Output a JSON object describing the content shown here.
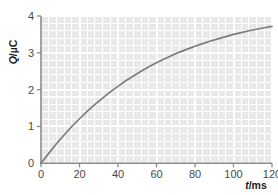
{
  "figure": {
    "background_color": "#ffffff",
    "plot_fill_color": "#e9e9e9",
    "gridline_color": "#ffffff",
    "axis_color": "#8a8a8a",
    "curve_color": "#7d7d7d",
    "tick_label_color": "#4a4a4a",
    "axis_title_color": "#1c1c1c"
  },
  "axis_titles": {
    "y": "Q/µC",
    "y_symbol": "Q",
    "y_unit": "/µC",
    "x": "t/ms",
    "x_symbol": "t",
    "x_unit": "/ms"
  },
  "ticks": {
    "x_labels": [
      "0",
      "20",
      "40",
      "60",
      "80",
      "100",
      "120"
    ],
    "y_labels": [
      "0",
      "1",
      "2",
      "3",
      "4"
    ]
  },
  "chart_data": {
    "type": "line",
    "title": "",
    "subtitle": "",
    "xlabel": "t/ms",
    "ylabel": "Q/µC",
    "xlim": [
      0,
      120
    ],
    "ylim": [
      0,
      4
    ],
    "x_major_tick_interval": 20,
    "y_major_tick_interval": 1,
    "x_minor_tick_interval": 4,
    "y_minor_tick_interval": 0.2,
    "grid": true,
    "grid_style": "shaded panel with white major and minor gridlines",
    "legend": false,
    "legend_position": "none",
    "annotations": [],
    "series": [
      {
        "name": "Q(t)",
        "description": "capacitor charging curve, exponential rise approaching saturation",
        "model": "Q = 3.62*(1 - exp(-t/51))",
        "x": [
          0,
          4,
          8,
          12,
          16,
          20,
          24,
          28,
          32,
          36,
          40,
          44,
          48,
          52,
          56,
          60,
          64,
          68,
          72,
          76,
          80,
          84,
          88,
          92,
          96,
          100,
          104,
          108,
          112,
          116,
          120
        ],
        "values": [
          0.0,
          0.27,
          0.53,
          0.77,
          1.0,
          1.21,
          1.41,
          1.6,
          1.77,
          1.94,
          2.09,
          2.24,
          2.37,
          2.5,
          2.62,
          2.73,
          2.83,
          2.93,
          3.02,
          3.1,
          3.18,
          3.25,
          3.32,
          3.38,
          3.44,
          3.5,
          3.55,
          3.6,
          3.64,
          3.68,
          3.72
        ]
      }
    ],
    "key_readings": [
      {
        "t": 0,
        "Q": 0.0
      },
      {
        "t": 20,
        "Q": 1.2
      },
      {
        "t": 40,
        "Q": 2.05
      },
      {
        "t": 60,
        "Q": 2.7
      },
      {
        "t": 80,
        "Q": 3.0
      },
      {
        "t": 100,
        "Q": 3.2
      },
      {
        "t": 120,
        "Q": 3.4
      }
    ]
  }
}
